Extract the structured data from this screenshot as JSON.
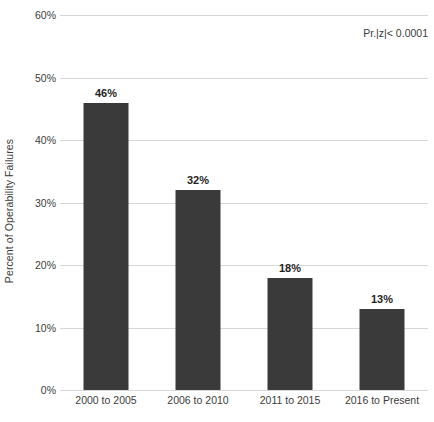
{
  "chart_data": {
    "type": "bar",
    "title": "",
    "subtitle": "",
    "xlabel": "",
    "ylabel": "Percent of Operability Failures",
    "categories": [
      "2000 to 2005",
      "2006 to 2010",
      "2011 to 2015",
      "2016 to Present"
    ],
    "values": [
      46,
      32,
      18,
      13
    ],
    "data_labels": [
      "46%",
      "32%",
      "18%",
      "13%"
    ],
    "ylim": [
      0,
      60
    ],
    "ytick_values": [
      0,
      10,
      20,
      30,
      40,
      50,
      60
    ],
    "ytick_labels": [
      "0%",
      "10%",
      "20%",
      "30%",
      "40%",
      "50%",
      "60%"
    ],
    "grid": true,
    "grid_axis": "y",
    "legend": false,
    "legend_position": "none",
    "annotations": [
      {
        "text": "Pr.|z|< 0.0001",
        "position": "top-right"
      }
    ],
    "bar_color": "#3a3a3a",
    "grid_color": "#d7d7d7",
    "background_color": "#ffffff",
    "text_color": "#3c3c3c"
  }
}
